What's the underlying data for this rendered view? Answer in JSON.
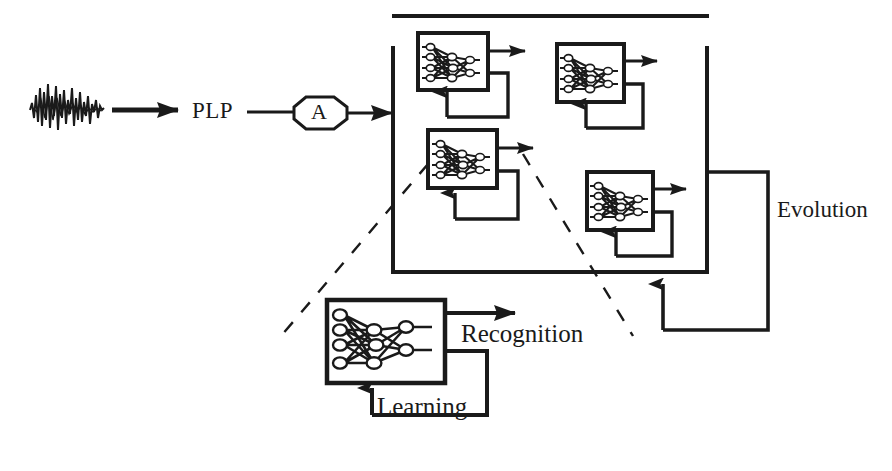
{
  "diagram": {
    "stroke_color": "#1a1a1a",
    "background_color": "#ffffff",
    "signal": {
      "name": "speech-waveform",
      "description": "noisy speech waveform"
    },
    "stage_plp": {
      "label": "PLP"
    },
    "node_a": {
      "label": "A",
      "shape": "octagon"
    },
    "population": {
      "name": "neural-network-population",
      "count": 4,
      "members": [
        {
          "id": "nn-1",
          "position": "top-left"
        },
        {
          "id": "nn-2",
          "position": "top-right"
        },
        {
          "id": "nn-3",
          "position": "middle-left"
        },
        {
          "id": "nn-4",
          "position": "bottom-right"
        }
      ]
    },
    "evolution": {
      "label": "Evolution"
    },
    "detail": {
      "name": "enlarged-network-detail",
      "recognition_label": "Recognition",
      "learning_label": "Learning"
    }
  }
}
